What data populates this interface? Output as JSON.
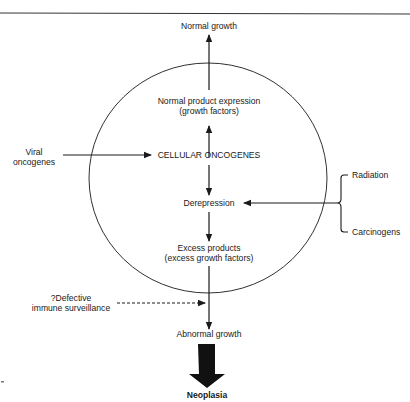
{
  "diagram": {
    "type": "flowchart",
    "colors": {
      "line": "#1a1a1a",
      "background": "#ffffff"
    },
    "nodes": {
      "normal_growth": "Normal growth",
      "normal_product_line1": "Normal product expression",
      "normal_product_line2": "(growth factors)",
      "cellular_oncogenes": "CELLULAR ONCOGENES",
      "derepression": "Derepression",
      "excess_products_line1": "Excess products",
      "excess_products_line2": "(excess growth factors)",
      "abnormal_growth": "Abnormal growth",
      "neoplasia": "Neoplasia"
    },
    "external_inputs": {
      "viral_line1": "Viral",
      "viral_line2": "oncogenes",
      "radiation": "Radiation",
      "carcinogens": "Carcinogens",
      "immune_line1": "?Defective",
      "immune_line2": "immune surveillance"
    },
    "edges": [
      {
        "from": "Normal product expression",
        "to": "Normal growth",
        "style": "solid"
      },
      {
        "from": "CELLULAR ONCOGENES",
        "to": "Normal product expression",
        "style": "solid"
      },
      {
        "from": "Viral oncogenes",
        "to": "CELLULAR ONCOGENES",
        "style": "solid"
      },
      {
        "from": "CELLULAR ONCOGENES",
        "to": "Derepression",
        "style": "solid"
      },
      {
        "from": "Radiation / Carcinogens",
        "to": "Derepression",
        "style": "solid"
      },
      {
        "from": "Derepression",
        "to": "Excess products",
        "style": "solid"
      },
      {
        "from": "Excess products",
        "to": "Abnormal growth",
        "style": "solid"
      },
      {
        "from": "?Defective immune surveillance",
        "to": "Abnormal growth pathway",
        "style": "dashed"
      },
      {
        "from": "Abnormal growth",
        "to": "Neoplasia",
        "style": "bold"
      }
    ],
    "stray_mark": ";-"
  }
}
